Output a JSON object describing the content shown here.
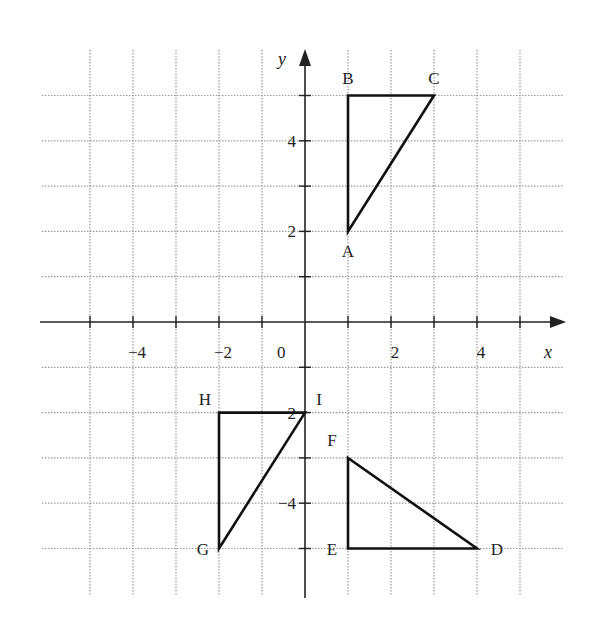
{
  "diagram": {
    "type": "coordinate-grid",
    "axes": {
      "x_label": "x",
      "y_label": "y",
      "origin_label": "0",
      "x_range": [
        -6,
        6
      ],
      "y_range": [
        -6,
        6
      ],
      "x_tick_labels": [
        {
          "value": -4,
          "text": "−4"
        },
        {
          "value": -2,
          "text": "−2"
        },
        {
          "value": 2,
          "text": "2"
        },
        {
          "value": 4,
          "text": "4"
        }
      ],
      "y_tick_labels": [
        {
          "value": 4,
          "text": "4"
        },
        {
          "value": 2,
          "text": "2"
        },
        {
          "value": -2,
          "text": "−2"
        },
        {
          "value": -4,
          "text": "−4"
        }
      ]
    },
    "grid": {
      "x_lines": [
        -5,
        -4,
        -3,
        -2,
        -1,
        1,
        2,
        3,
        4,
        5
      ],
      "y_lines": [
        5,
        4,
        3,
        2,
        1,
        -1,
        -2,
        -3,
        -4,
        -5
      ],
      "style": "dotted",
      "color": "#9a9a9a"
    },
    "shapes": [
      {
        "name": "triangle-ABC",
        "vertices": [
          {
            "label": "A",
            "x": 1,
            "y": 2
          },
          {
            "label": "B",
            "x": 1,
            "y": 5
          },
          {
            "label": "C",
            "x": 3,
            "y": 5
          }
        ]
      },
      {
        "name": "triangle-DEF",
        "vertices": [
          {
            "label": "D",
            "x": 4,
            "y": -5
          },
          {
            "label": "E",
            "x": 1,
            "y": -5
          },
          {
            "label": "F",
            "x": 1,
            "y": -3
          }
        ]
      },
      {
        "name": "triangle-GHI",
        "vertices": [
          {
            "label": "G",
            "x": -2,
            "y": -5
          },
          {
            "label": "H",
            "x": -2,
            "y": -2
          },
          {
            "label": "I",
            "x": 0,
            "y": -2
          }
        ]
      }
    ],
    "colors": {
      "axis": "#222222",
      "shape_stroke": "#111111",
      "text": "#222222"
    }
  }
}
